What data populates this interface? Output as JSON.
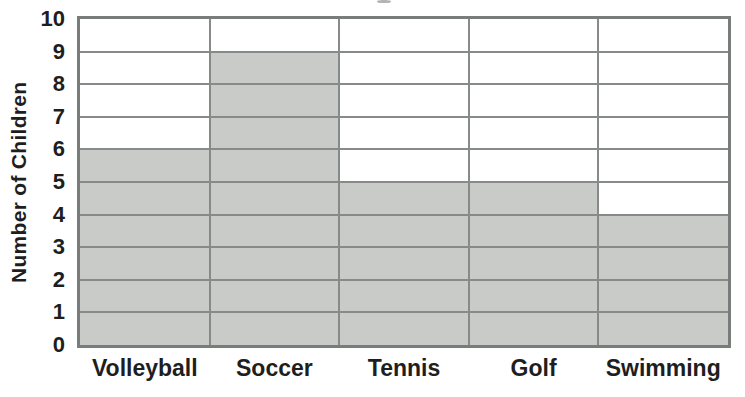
{
  "chart_data": {
    "type": "bar",
    "categories": [
      "Volleyball",
      "Soccer",
      "Tennis",
      "Golf",
      "Swimming"
    ],
    "values": [
      6,
      9,
      5,
      5,
      4
    ],
    "xlabel": "",
    "ylabel": "Number of Children",
    "ylim": [
      0,
      10
    ],
    "ytick_step": 1,
    "yticks": [
      "0",
      "1",
      "2",
      "3",
      "4",
      "5",
      "6",
      "7",
      "8",
      "9",
      "10"
    ],
    "grid": "horizontal gridlines at every integer plus vertical column separators; gridlines drawn over shaded bars",
    "legend": "none",
    "style": "grid-shading bar chart (cells filled up to value)",
    "colors": {
      "bar_fill": "#c9cbc8",
      "grid_line": "#868a89",
      "plot_border": "#787c7b",
      "text": "#1e1e1e",
      "background": "#ffffff"
    }
  }
}
